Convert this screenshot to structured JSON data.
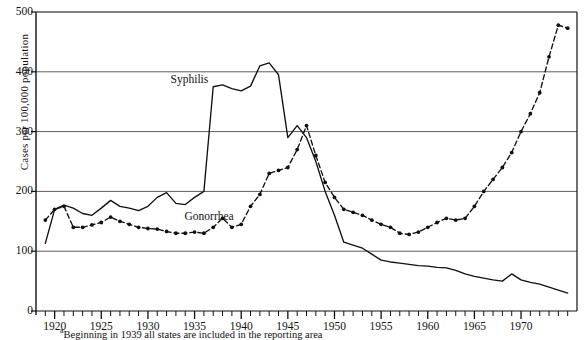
{
  "chart_data": {
    "type": "line",
    "title": "",
    "xlabel": "",
    "ylabel": "Cases per 100,000 population",
    "xlim": [
      1918,
      1976
    ],
    "ylim": [
      0,
      500
    ],
    "yticks": [
      0,
      100,
      200,
      300,
      400,
      500
    ],
    "xticks": [
      1920,
      1925,
      1930,
      1935,
      1940,
      1945,
      1950,
      1955,
      1960,
      1965,
      1970
    ],
    "xtick_minor_step": 1,
    "grid": "horizontal",
    "legend_position": "inline-annotations",
    "footnote": "Beginning in 1939 all states are included in the reporting area",
    "footnote_marker": "a",
    "series": [
      {
        "name": "Syphilis",
        "style": "solid",
        "markers": false,
        "color": "#111111",
        "label_x": 1935.0,
        "label_y": 385,
        "x": [
          1919,
          1920,
          1921,
          1922,
          1923,
          1924,
          1925,
          1926,
          1927,
          1928,
          1929,
          1930,
          1931,
          1932,
          1933,
          1934,
          1935,
          1936,
          1937,
          1938,
          1939,
          1940,
          1941,
          1942,
          1943,
          1944,
          1945,
          1946,
          1947,
          1948,
          1949,
          1950,
          1951,
          1952,
          1953,
          1954,
          1955,
          1956,
          1957,
          1958,
          1959,
          1960,
          1961,
          1962,
          1963,
          1964,
          1965,
          1966,
          1967,
          1968,
          1969,
          1970,
          1971,
          1972,
          1973,
          1974,
          1975
        ],
        "y": [
          113,
          170,
          177,
          172,
          163,
          160,
          172,
          185,
          175,
          172,
          168,
          175,
          190,
          198,
          180,
          178,
          190,
          200,
          375,
          378,
          372,
          368,
          376,
          410,
          415,
          395,
          290,
          310,
          290,
          250,
          200,
          160,
          115,
          110,
          105,
          95,
          85,
          82,
          80,
          78,
          76,
          75,
          73,
          72,
          68,
          62,
          58,
          55,
          52,
          50,
          62,
          52,
          48,
          45,
          40,
          35,
          30
        ]
      },
      {
        "name": "Gonorrhea",
        "style": "dotted",
        "markers": true,
        "color": "#111111",
        "label_x": 1936.5,
        "label_y": 155,
        "x": [
          1919,
          1920,
          1921,
          1922,
          1923,
          1924,
          1925,
          1926,
          1927,
          1928,
          1929,
          1930,
          1931,
          1932,
          1933,
          1934,
          1935,
          1936,
          1937,
          1938,
          1939,
          1940,
          1941,
          1942,
          1943,
          1944,
          1945,
          1946,
          1947,
          1948,
          1949,
          1950,
          1951,
          1952,
          1953,
          1954,
          1955,
          1956,
          1957,
          1958,
          1959,
          1960,
          1961,
          1962,
          1963,
          1964,
          1965,
          1966,
          1967,
          1968,
          1969,
          1970,
          1971,
          1972,
          1973,
          1974,
          1975
        ],
        "y": [
          152,
          170,
          175,
          140,
          140,
          144,
          148,
          157,
          150,
          145,
          140,
          138,
          137,
          133,
          130,
          130,
          132,
          130,
          140,
          155,
          140,
          145,
          175,
          195,
          230,
          235,
          240,
          270,
          310,
          260,
          215,
          190,
          170,
          165,
          160,
          152,
          145,
          140,
          130,
          128,
          132,
          140,
          148,
          155,
          152,
          155,
          175,
          200,
          220,
          240,
          265,
          300,
          330,
          365,
          425,
          478,
          473
        ]
      }
    ]
  }
}
